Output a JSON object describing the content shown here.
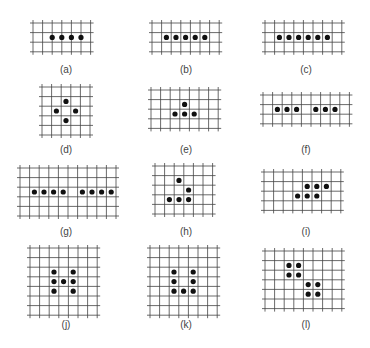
{
  "figure": {
    "grid_color": "#444444",
    "dot_color": "#111111",
    "cell": 9.6,
    "panels": [
      {
        "label": "(a)",
        "x": 33,
        "y": 23,
        "cols": 7,
        "rows": 4,
        "dots": [
          [
            2,
            1.5
          ],
          [
            3,
            1.5
          ],
          [
            4,
            1.5
          ],
          [
            5,
            1.5
          ]
        ],
        "cap_x": 66,
        "cap_y": 70
      },
      {
        "label": "(b)",
        "x": 152,
        "y": 23,
        "cols": 8,
        "rows": 4,
        "dots": [
          [
            1.5,
            1.5
          ],
          [
            2.5,
            1.5
          ],
          [
            3.5,
            1.5
          ],
          [
            4.5,
            1.5
          ],
          [
            5.5,
            1.5
          ]
        ],
        "cap_x": 186,
        "cap_y": 70
      },
      {
        "label": "(c)",
        "x": 265,
        "y": 23,
        "cols": 9,
        "rows": 4,
        "dots": [
          [
            1.5,
            1.5
          ],
          [
            2.5,
            1.5
          ],
          [
            3.5,
            1.5
          ],
          [
            4.5,
            1.5
          ],
          [
            5.5,
            1.5
          ],
          [
            6.5,
            1.5
          ]
        ],
        "cap_x": 306,
        "cap_y": 70
      },
      {
        "label": "(d)",
        "x": 42,
        "y": 87,
        "cols": 6,
        "rows": 6,
        "dots": [
          [
            2.5,
            1.5
          ],
          [
            1.5,
            2.5
          ],
          [
            3.5,
            2.5
          ],
          [
            2.5,
            3.5
          ]
        ],
        "cap_x": 66,
        "cap_y": 150
      },
      {
        "label": "(e)",
        "x": 151,
        "y": 90,
        "cols": 8,
        "rows": 5,
        "dots": [
          [
            3.5,
            1.5
          ],
          [
            2.5,
            2.5
          ],
          [
            3.5,
            2.5
          ],
          [
            4.5,
            2.5
          ]
        ],
        "cap_x": 186,
        "cap_y": 150
      },
      {
        "label": "(f)",
        "x": 263,
        "y": 95,
        "cols": 10,
        "rows": 4,
        "dots": [
          [
            1.5,
            1.5
          ],
          [
            2.5,
            1.5
          ],
          [
            3.5,
            1.5
          ],
          [
            5.5,
            1.5
          ],
          [
            6.5,
            1.5
          ],
          [
            7.5,
            1.5
          ]
        ],
        "cap_x": 306,
        "cap_y": 150
      },
      {
        "label": "(g)",
        "x": 20,
        "y": 168,
        "cols": 11,
        "rows": 6,
        "dots": [
          [
            1.5,
            2.5
          ],
          [
            2.5,
            2.5
          ],
          [
            3.5,
            2.5
          ],
          [
            4.5,
            2.5
          ],
          [
            6.5,
            2.5
          ],
          [
            7.5,
            2.5
          ],
          [
            8.5,
            2.5
          ],
          [
            9.5,
            2.5
          ]
        ],
        "cap_x": 66,
        "cap_y": 232
      },
      {
        "label": "(h)",
        "x": 155,
        "y": 166,
        "cols": 7,
        "rows": 6,
        "dots": [
          [
            2.5,
            1.5
          ],
          [
            3.5,
            2.5
          ],
          [
            1.5,
            3.5
          ],
          [
            2.5,
            3.5
          ],
          [
            3.5,
            3.5
          ]
        ],
        "cap_x": 186,
        "cap_y": 232
      },
      {
        "label": "(i)",
        "x": 264,
        "y": 172,
        "cols": 9,
        "rows": 5,
        "dots": [
          [
            4.5,
            1.5
          ],
          [
            5.5,
            1.5
          ],
          [
            6.5,
            1.5
          ],
          [
            3.5,
            2.5
          ],
          [
            4.5,
            2.5
          ],
          [
            5.5,
            2.5
          ]
        ],
        "cap_x": 306,
        "cap_y": 232
      },
      {
        "label": "(j)",
        "x": 30,
        "y": 248,
        "cols": 8,
        "rows": 8,
        "dots": [
          [
            2.5,
            2.5
          ],
          [
            4.5,
            2.5
          ],
          [
            2.5,
            3.5
          ],
          [
            3.5,
            3.5
          ],
          [
            4.5,
            3.5
          ],
          [
            2.5,
            4.5
          ],
          [
            4.5,
            4.5
          ]
        ],
        "cap_x": 66,
        "cap_y": 325
      },
      {
        "label": "(k)",
        "x": 150,
        "y": 248,
        "cols": 8,
        "rows": 8,
        "dots": [
          [
            2.5,
            2.5
          ],
          [
            4.5,
            2.5
          ],
          [
            2.5,
            3.5
          ],
          [
            4.5,
            3.5
          ],
          [
            2.5,
            4.5
          ],
          [
            3.5,
            4.5
          ],
          [
            4.5,
            4.5
          ]
        ],
        "cap_x": 186,
        "cap_y": 325
      },
      {
        "label": "(l)",
        "x": 265,
        "y": 251,
        "cols": 9,
        "rows": 7,
        "dots": [
          [
            2.5,
            1.5
          ],
          [
            3.5,
            1.5
          ],
          [
            2.5,
            2.5
          ],
          [
            3.5,
            2.5
          ],
          [
            4.5,
            3.5
          ],
          [
            5.5,
            3.5
          ],
          [
            4.5,
            4.5
          ],
          [
            5.5,
            4.5
          ]
        ],
        "cap_x": 306,
        "cap_y": 325
      }
    ]
  }
}
